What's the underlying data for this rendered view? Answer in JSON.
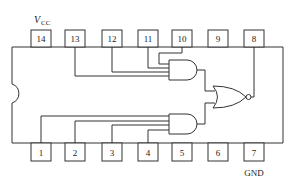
{
  "diagram": {
    "type": "IC pinout / logic diagram",
    "labels": {
      "vcc_main": "V",
      "vcc_sub": "CC",
      "gnd": "GND"
    },
    "top_pins": [
      {
        "num": "14",
        "label": "14"
      },
      {
        "num": "13",
        "label": "13"
      },
      {
        "num": "12",
        "label": "12"
      },
      {
        "num": "11",
        "label": "11"
      },
      {
        "num": "10",
        "label": "10"
      },
      {
        "num": "9",
        "label": "9"
      },
      {
        "num": "8",
        "label": "8"
      }
    ],
    "bottom_pins": [
      {
        "num": "1",
        "label": "1"
      },
      {
        "num": "2",
        "label": "2"
      },
      {
        "num": "3",
        "label": "3"
      },
      {
        "num": "4",
        "label": "4"
      },
      {
        "num": "5",
        "label": "5"
      },
      {
        "num": "6",
        "label": "6"
      },
      {
        "num": "7",
        "label": "7"
      }
    ],
    "gates": [
      {
        "id": "and-top",
        "type": "AND",
        "inputs": [
          "13",
          "12",
          "11",
          "10"
        ]
      },
      {
        "id": "and-bottom",
        "type": "AND",
        "inputs": [
          "1",
          "2",
          "3",
          "4"
        ]
      },
      {
        "id": "nor-out",
        "type": "NOR",
        "inputs": [
          "and-top",
          "and-bottom"
        ],
        "output": "8"
      }
    ],
    "colors": {
      "line": "#333333",
      "background": "#ffffff"
    }
  }
}
